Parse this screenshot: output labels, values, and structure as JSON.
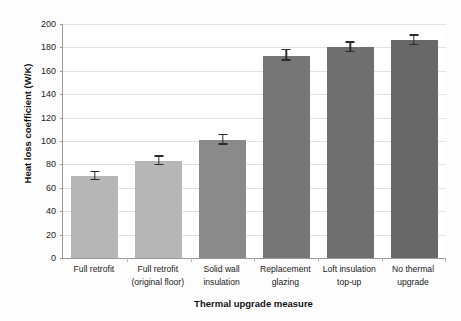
{
  "chart_data": {
    "type": "bar",
    "title": "",
    "xlabel": "Thermal upgrade measure",
    "ylabel": "Heat loss coefficient (W/K)",
    "ylim": [
      0,
      200
    ],
    "ytick_values": [
      0,
      20,
      40,
      60,
      80,
      100,
      120,
      140,
      160,
      180,
      200
    ],
    "ytick_labels": [
      "0",
      "20",
      "40",
      "60",
      "80",
      "100",
      "120",
      "140",
      "160",
      "180",
      "200"
    ],
    "grid": "horizontal",
    "legend": "none",
    "categories": [
      "Full retrofit",
      "Full retrofit (original floor)",
      "Solid wall insulation",
      "Replacement glazing",
      "Loft insulation top-up",
      "No thermal upgrade"
    ],
    "category_lines": [
      [
        "Full retrofit"
      ],
      [
        "Full retrofit",
        "(original floor)"
      ],
      [
        "Solid wall",
        "insulation"
      ],
      [
        "Replacement",
        "glazing"
      ],
      [
        "Loft insulation",
        "top-up"
      ],
      [
        "No thermal",
        "upgrade"
      ]
    ],
    "values": [
      70,
      83,
      101,
      173,
      180,
      186
    ],
    "errors": [
      3.5,
      3.5,
      4.0,
      4.5,
      4.0,
      4.0
    ],
    "bar_colors": [
      "#b6b6b6",
      "#b6b6b6",
      "#8a8a8a",
      "#767676",
      "#6f6f6f",
      "#686868"
    ],
    "error_bar_color": "#2b2b2b"
  },
  "style": {
    "plot_background": "#ffffff",
    "figure_background": "#fdfdfd",
    "gridline_color": "#e2e2e2",
    "axis_color": "#9a9a9a",
    "text_color": "#1a1a1a"
  }
}
